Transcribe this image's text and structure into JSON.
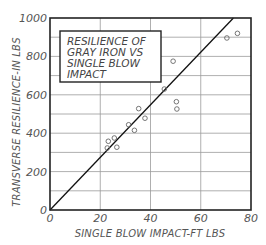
{
  "chart_data": {
    "type": "scatter",
    "title": "RESILIENCE OF GRAY IRON VS SINGLE BLOW IMPACT",
    "title_lines": [
      "RESILIENCE OF",
      "GRAY IRON VS",
      "SINGLE BLOW",
      "IMPACT"
    ],
    "xlabel": "SINGLE BLOW IMPACT-FT LBS",
    "ylabel": "TRANSVERSE RESILIENCE-IN LBS",
    "xlim": [
      0,
      80
    ],
    "ylim": [
      0,
      1000
    ],
    "x_ticks": [
      0,
      20,
      40,
      60,
      80
    ],
    "y_ticks": [
      0,
      200,
      400,
      600,
      800,
      1000
    ],
    "x_ticks_labels": [
      "0",
      "20",
      "40",
      "60",
      "80"
    ],
    "y_ticks_labels": [
      "0",
      "200",
      "400",
      "600",
      "800",
      "1000"
    ],
    "grid": true,
    "grid_x_step": 20,
    "grid_y_step": 100,
    "legend": null,
    "series": [
      {
        "name": "Test specimens",
        "marker": "open-circle",
        "points": [
          {
            "x": 22.8,
            "y": 323
          },
          {
            "x": 23.2,
            "y": 358
          },
          {
            "x": 25.6,
            "y": 375
          },
          {
            "x": 26.6,
            "y": 327
          },
          {
            "x": 31.3,
            "y": 444
          },
          {
            "x": 33.6,
            "y": 415
          },
          {
            "x": 35.3,
            "y": 528
          },
          {
            "x": 37.8,
            "y": 478
          },
          {
            "x": 45.5,
            "y": 630
          },
          {
            "x": 49.0,
            "y": 775
          },
          {
            "x": 50.3,
            "y": 564
          },
          {
            "x": 50.5,
            "y": 526
          },
          {
            "x": 70.4,
            "y": 896
          },
          {
            "x": 74.6,
            "y": 920
          }
        ]
      },
      {
        "name": "Trend line",
        "type": "line",
        "points": [
          {
            "x": 0,
            "y": 0
          },
          {
            "x": 73,
            "y": 1000
          }
        ]
      }
    ]
  },
  "colors": {
    "frame": "#222222",
    "grid": "#9a9a9a",
    "trend_line": "#111111",
    "marker": "#666666",
    "text": "#555555"
  }
}
